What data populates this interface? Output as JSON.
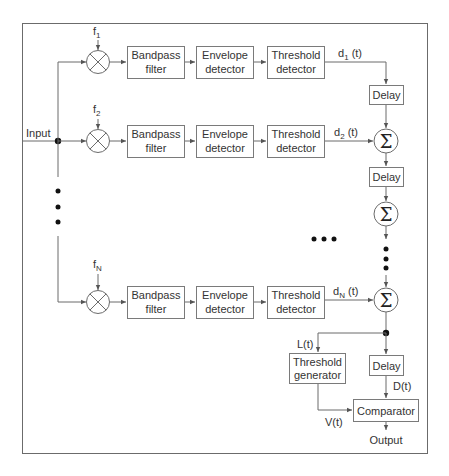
{
  "diagram": {
    "input_label": "Input",
    "output_label": "Output",
    "rows": [
      {
        "freq": "f",
        "freq_sub": "1",
        "signal": "d",
        "signal_sub": "1",
        "signal_suffix": " (t)",
        "bandpass": [
          "Bandpass",
          "filter"
        ],
        "envelope": [
          "Envelope",
          "detector"
        ],
        "threshold": [
          "Threshold",
          "detector"
        ]
      },
      {
        "freq": "f",
        "freq_sub": "2",
        "signal": "d",
        "signal_sub": "2",
        "signal_suffix": " (t)",
        "bandpass": [
          "Bandpass",
          "filter"
        ],
        "envelope": [
          "Envelope",
          "detector"
        ],
        "threshold": [
          "Threshold",
          "detector"
        ]
      },
      {
        "freq": "f",
        "freq_sub": "N",
        "signal": "d",
        "signal_sub": "N",
        "signal_suffix": " (t)",
        "bandpass": [
          "Bandpass",
          "filter"
        ],
        "envelope": [
          "Envelope",
          "detector"
        ],
        "threshold": [
          "Threshold",
          "detector"
        ]
      }
    ],
    "delay_label": "Delay",
    "sum_symbol": "Σ",
    "threshold_generator": [
      "Threshold",
      "generator"
    ],
    "comparator_label": "Comparator",
    "signals": {
      "L": "L(t)",
      "D": "D(t)",
      "V": "V(t)"
    },
    "colors": {
      "line": "#6b6b6b",
      "box_border": "#7a7a7a",
      "text": "#333333",
      "dot": "#111111"
    }
  }
}
